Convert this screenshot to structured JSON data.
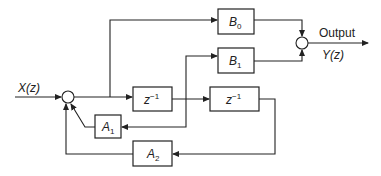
{
  "diagram": {
    "type": "signal-flow block diagram (second-order IIR filter)",
    "input_label": "X(z)",
    "output_label": "Output",
    "output_signal": "Y(z)",
    "blocks": {
      "b0": {
        "base": "B",
        "sub": "0"
      },
      "b1": {
        "base": "B",
        "sub": "1"
      },
      "a1": {
        "base": "A",
        "sub": "1"
      },
      "a2": {
        "base": "A",
        "sub": "2"
      },
      "delay1": {
        "base": "z",
        "sup": "−1"
      },
      "delay2": {
        "base": "z",
        "sup": "−1"
      }
    },
    "colors": {
      "line": "#222222",
      "background": "#ffffff"
    }
  }
}
